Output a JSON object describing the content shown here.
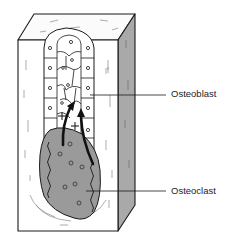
{
  "diagram": {
    "type": "anatomical-cutaway",
    "labels": [
      {
        "id": "osteoblast",
        "text": "Osteoblast"
      },
      {
        "id": "osteoclast",
        "text": "Osteoclast"
      }
    ],
    "symbols": [
      "+",
      "+"
    ],
    "colors": {
      "line": "#1a1a1a",
      "bone": "#ffffff",
      "side_face": "#a9a9a9",
      "osteoclast_fill": "#9a9a9a",
      "cell_fill": "#ffffff",
      "label_text": "#222222"
    }
  }
}
